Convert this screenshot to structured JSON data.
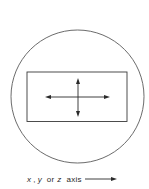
{
  "diagram": {
    "outer_shape": "circle",
    "inner_shape": "rectangle",
    "center_symbol": "four-way-arrow-cross",
    "stroke_color": "#4a4a4a"
  },
  "axis_label": {
    "var1": "x",
    "sep1": ",",
    "var2": "y",
    "word_or": "or",
    "var3": "z",
    "word_axis": "axis",
    "arrow": "right-arrow-icon"
  }
}
